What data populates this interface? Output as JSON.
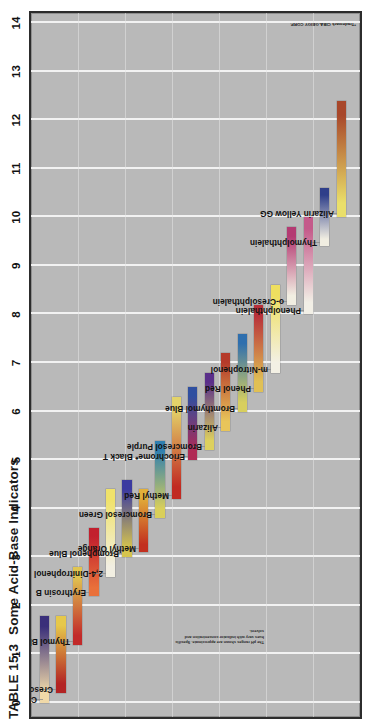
{
  "figure": {
    "table_tag": "TABLE 15.3",
    "title": "Some Acid-Base Indicators",
    "axis_label_note": "pH",
    "footnote": "The pH ranges shown are approximate. Specific hues vary with indicator concentration and solvent.",
    "credit": "*Trademark CIBA-GEIGY CORP."
  },
  "chart_data": {
    "type": "bar",
    "title": "Some Acid-Base Indicators",
    "xlabel": "",
    "ylabel": "pH",
    "ylim": [
      0,
      14
    ],
    "grid": true,
    "legend": "none",
    "orientation": "vertical-range-bars",
    "tick_labels": [
      "0",
      "1",
      "2",
      "3",
      "4",
      "5",
      "6",
      "7",
      "8",
      "9",
      "10",
      "11",
      "12",
      "13",
      "14"
    ],
    "tick_values": [
      0,
      1,
      2,
      3,
      4,
      5,
      6,
      7,
      8,
      9,
      10,
      11,
      12,
      13,
      14
    ],
    "categories": [
      "Crystal Violet",
      "Cresol Red",
      "Thymol Blue",
      "Erythrosin B",
      "2,4-Dinitrophenol",
      "Bromphenol Blue",
      "Methyl Orange",
      "Bromcresol Green",
      "Methyl Red",
      "Eriochrome* Black T",
      "Bromcresol Purple",
      "Alizarin",
      "Bromthymol Blue",
      "Phenol Red",
      "m-Nitrophenol",
      "o-Cresolphthalein",
      "Phenolphthalein",
      "Thymolphthalein",
      "Alizarin Yellow GG"
    ],
    "series": [
      {
        "name": "pH transition range",
        "ranges": [
          {
            "indicator": "Crystal Violet",
            "low": 0.0,
            "high": 1.8,
            "acid_color": "#f0d9a8",
            "base_color": "#3a2f7a"
          },
          {
            "indicator": "Cresol Red",
            "low": 0.2,
            "high": 1.8,
            "acid_color": "#b32424",
            "base_color": "#e6c84a"
          },
          {
            "indicator": "Thymol Blue",
            "low": 1.2,
            "high": 2.8,
            "acid_color": "#c22a2a",
            "base_color": "#e0c551"
          },
          {
            "indicator": "Erythrosin B",
            "low": 2.2,
            "high": 3.6,
            "acid_color": "#e9703a",
            "base_color": "#c2202e"
          },
          {
            "indicator": "2,4-Dinitrophenol",
            "low": 2.6,
            "high": 4.4,
            "acid_color": "#f2efe2",
            "base_color": "#f0e26a"
          },
          {
            "indicator": "Bromphenol Blue",
            "low": 3.0,
            "high": 4.6,
            "acid_color": "#d6c44e",
            "base_color": "#3b3aa0"
          },
          {
            "indicator": "Methyl Orange",
            "low": 3.1,
            "high": 4.4,
            "acid_color": "#c2301f",
            "base_color": "#e2b03a"
          },
          {
            "indicator": "Bromcresol Green",
            "low": 3.8,
            "high": 5.4,
            "acid_color": "#d9cf5a",
            "base_color": "#2f7fb0"
          },
          {
            "indicator": "Methyl Red",
            "low": 4.2,
            "high": 6.3,
            "acid_color": "#c12a22",
            "base_color": "#e3d36a"
          },
          {
            "indicator": "Eriochrome* Black T",
            "low": 5.0,
            "high": 6.5,
            "acid_color": "#b02a55",
            "base_color": "#2f4fa0"
          },
          {
            "indicator": "Bromcresol Purple",
            "low": 5.2,
            "high": 6.8,
            "acid_color": "#ddd05e",
            "base_color": "#5a2f8a"
          },
          {
            "indicator": "Alizarin",
            "low": 5.6,
            "high": 7.2,
            "acid_color": "#e8c55a",
            "base_color": "#b53a2a"
          },
          {
            "indicator": "Bromthymol Blue",
            "low": 6.0,
            "high": 7.6,
            "acid_color": "#d8cf5e",
            "base_color": "#2f6fae"
          },
          {
            "indicator": "Phenol Red",
            "low": 6.4,
            "high": 8.2,
            "acid_color": "#e0c055",
            "base_color": "#b8303a"
          },
          {
            "indicator": "m-Nitrophenol",
            "low": 6.8,
            "high": 8.6,
            "acid_color": "#f3f0e4",
            "base_color": "#eedf5f"
          },
          {
            "indicator": "o-Cresolphthalein",
            "low": 8.2,
            "high": 9.8,
            "acid_color": "#f1eee2",
            "base_color": "#b43a72"
          },
          {
            "indicator": "Phenolphthalein",
            "low": 8.0,
            "high": 10.0,
            "acid_color": "#f2efe6",
            "base_color": "#c45a8a"
          },
          {
            "indicator": "Thymolphthalein",
            "low": 9.4,
            "high": 10.6,
            "acid_color": "#f0ede1",
            "base_color": "#2f3f8a"
          },
          {
            "indicator": "Alizarin Yellow GG",
            "low": 10.0,
            "high": 12.4,
            "acid_color": "#eadf6a",
            "base_color": "#a8472a"
          }
        ]
      }
    ]
  }
}
